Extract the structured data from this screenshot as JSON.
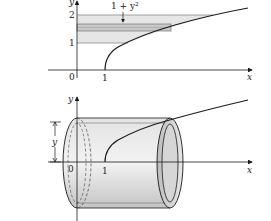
{
  "figure": {
    "top_graph": {
      "x_axis_label": "x",
      "y_axis_label": "y",
      "origin_label": "0",
      "x_tick_labels": [
        "1"
      ],
      "y_tick_labels": [
        "1",
        "2"
      ],
      "curve": "x = 1 + y^2",
      "strip_annotation": "1 + y²",
      "shaded_region": {
        "y_from": 1,
        "y_to": 2
      }
    },
    "bottom_graph": {
      "x_axis_label": "x",
      "y_axis_label": "y",
      "origin_label": "0",
      "x_tick_labels": [
        "1"
      ],
      "radius_label": "y",
      "shape": "cylindrical shell"
    },
    "colors": {
      "line": "#1a1a1a",
      "shade_light": "#e6e6e6",
      "shade_dark": "#c8c8c8",
      "shell_fill": "#d9d9d9"
    }
  }
}
